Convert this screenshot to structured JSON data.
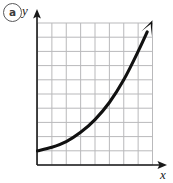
{
  "figure": {
    "part_label": "a",
    "y_axis_label": "y",
    "x_axis_label": "x",
    "colors": {
      "grid": "#b9b9bb",
      "axis": "#1a1a1a",
      "curve": "#111111",
      "part_label_ring": "#58585a",
      "background": "#ffffff"
    }
  },
  "chart_data": {
    "type": "line",
    "title": "",
    "subtitle": "",
    "xlabel": "x",
    "ylabel": "y",
    "grid": true,
    "legend": null,
    "axis_arrows": {
      "x": "right",
      "y": "up"
    },
    "curve_arrow": "end",
    "grid_columns": 8,
    "grid_rows": 10,
    "xlim": [
      0,
      8
    ],
    "ylim": [
      0,
      10
    ],
    "tick_labels_x": [],
    "tick_labels_y": [],
    "annotations": [
      "a"
    ],
    "series": [
      {
        "name": "exponential growth curve",
        "x": [
          0,
          1,
          2,
          3,
          4,
          5,
          6,
          7,
          8
        ],
        "y": [
          1.0,
          1.25,
          1.65,
          2.3,
          3.2,
          4.4,
          6.0,
          8.0,
          10.2
        ]
      }
    ]
  }
}
